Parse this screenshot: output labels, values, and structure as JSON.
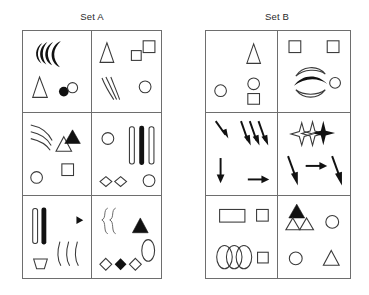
{
  "figure": {
    "type": "abstract-reasoning-shape-sets",
    "sets": [
      {
        "id": "set-a",
        "label": "Set A",
        "cells": [
          {
            "position": "row1-col1",
            "shapes": [
              "three-nested-filled-crescents",
              "outline-narrow-triangle",
              "small-filled-circle",
              "small-outline-circle"
            ]
          },
          {
            "position": "row1-col2",
            "shapes": [
              "outline-narrow-triangle",
              "small-outline-square",
              "outline-square",
              "three-thin-arcs",
              "outline-circle"
            ]
          },
          {
            "position": "row2-col1",
            "shapes": [
              "three-thin-arcs",
              "outline-triangle",
              "small-filled-triangle",
              "outline-square",
              "outline-circle"
            ]
          },
          {
            "position": "row2-col2",
            "shapes": [
              "outline-circle",
              "three-vertical-bars-middle-filled",
              "two-outline-diamonds",
              "outline-circle"
            ]
          },
          {
            "position": "row3-col1",
            "shapes": [
              "two-vertical-bars-right-filled",
              "right-arrow",
              "three-thin-vertical-arcs",
              "outline-trapezoid"
            ]
          },
          {
            "position": "row3-col2",
            "shapes": [
              "two-brace-curves",
              "filled-triangle",
              "outline-ellipse",
              "three-diamonds-middle-filled"
            ]
          }
        ]
      },
      {
        "id": "set-b",
        "label": "Set B",
        "cells": [
          {
            "position": "row1-col1",
            "shapes": [
              "three-thick-slanted-strokes",
              "outline-narrow-triangle",
              "outline-circle",
              "outline-circle",
              "outline-square"
            ]
          },
          {
            "position": "row1-col2",
            "shapes": [
              "outline-square",
              "outline-square",
              "three-stacked-arcs-middle-filled",
              "outline-circle"
            ]
          },
          {
            "position": "row2-col1",
            "shapes": [
              "small-diagonal-arrow",
              "three-diagonal-arrows",
              "down-arrow",
              "right-arrow"
            ]
          },
          {
            "position": "row2-col2",
            "shapes": [
              "three-four-point-stars-last-filled",
              "diagonal-down-arrow",
              "right-arrow",
              "diagonal-down-arrow"
            ]
          },
          {
            "position": "row3-col1",
            "shapes": [
              "outline-rectangle",
              "outline-square",
              "three-overlapping-ellipses",
              "outline-square"
            ]
          },
          {
            "position": "row3-col2",
            "shapes": [
              "filled-triangle",
              "two-outline-triangles",
              "outline-circle",
              "outline-circle",
              "outline-triangle"
            ]
          }
        ]
      }
    ]
  },
  "colors": {
    "ink": "#111111",
    "stroke": "#3a3a3a",
    "light_stroke": "#6e6e6e",
    "background": "#ffffff"
  }
}
